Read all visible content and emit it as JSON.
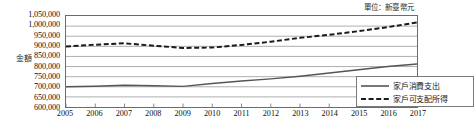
{
  "unit_note": "單位：新臺幣元",
  "y_axis_title": "金額",
  "legend": {
    "items": [
      {
        "label": "家戶消費支出",
        "style": "solid",
        "color": "#555555"
      },
      {
        "label": "家戶可支配所得",
        "style": "dashed",
        "color": "#1a1a1a"
      }
    ]
  },
  "chart_data": {
    "type": "line",
    "title": "",
    "subtitle": "",
    "xlabel": "",
    "ylabel": "金額",
    "unit": "單位：新臺幣元",
    "grid": true,
    "legend_position": "bottom-right",
    "xlim": [
      2005,
      2017
    ],
    "ylim": [
      600000,
      1050000
    ],
    "ytick_step": 50000,
    "categories": [
      2005,
      2006,
      2007,
      2008,
      2009,
      2010,
      2011,
      2012,
      2013,
      2014,
      2015,
      2016,
      2017
    ],
    "x": [
      "2005",
      "2006",
      "2007",
      "2008",
      "2009",
      "2010",
      "2011",
      "2012",
      "2013",
      "2014",
      "2015",
      "2016",
      "2017"
    ],
    "ytick_labels": [
      "1,050,000",
      "1,000,000",
      "950,000",
      "900,000",
      "850,000",
      "800,000",
      "750,000",
      "700,000",
      "650,000",
      "600,000"
    ],
    "ytick_values": [
      1050000,
      1000000,
      950000,
      900000,
      850000,
      800000,
      750000,
      700000,
      650000,
      600000
    ],
    "series": [
      {
        "name": "家戶消費支出",
        "style": "solid",
        "color": "#555555",
        "values": [
          700000,
          703000,
          708000,
          705000,
          702000,
          716000,
          729000,
          739000,
          752000,
          768000,
          784000,
          800000,
          813000
        ]
      },
      {
        "name": "家戶可支配所得",
        "style": "dashed",
        "color": "#1a1a1a",
        "values": [
          899000,
          908000,
          915000,
          903000,
          892000,
          894000,
          907000,
          923000,
          942000,
          957000,
          975000,
          995000,
          1018000
        ]
      }
    ]
  }
}
